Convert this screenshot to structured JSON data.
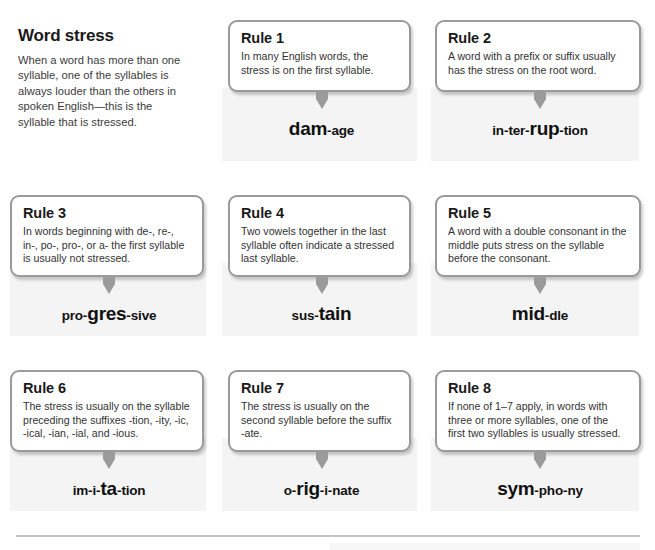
{
  "intro": {
    "title": "Word stress",
    "body": "When a word has more than one syllable, one of the syllables is always louder than the others in spoken English—this is the syllable that is stressed."
  },
  "rules": [
    {
      "title": "Rule 1",
      "body": "In many English words, the stress is on the first syllable.",
      "example_word": "dam-age",
      "syllables": [
        {
          "text": "dam",
          "stressed": true
        },
        {
          "text": "age",
          "stressed": false
        }
      ]
    },
    {
      "title": "Rule 2",
      "body": "A word with a prefix or suffix usually has the stress on the root word.",
      "example_word": "in-ter-rup-tion",
      "syllables": [
        {
          "text": "in",
          "stressed": false
        },
        {
          "text": "ter",
          "stressed": false
        },
        {
          "text": "rup",
          "stressed": true
        },
        {
          "text": "tion",
          "stressed": false
        }
      ]
    },
    {
      "title": "Rule 3",
      "body": "In words beginning with de-, re-, in-, po-, pro-, or a- the first syllable is usually not stressed.",
      "example_word": "pro-gres-sive",
      "syllables": [
        {
          "text": "pro",
          "stressed": false
        },
        {
          "text": "gres",
          "stressed": true
        },
        {
          "text": "sive",
          "stressed": false
        }
      ]
    },
    {
      "title": "Rule 4",
      "body": "Two vowels together in the last syllable often indicate a stressed last syllable.",
      "example_word": "sus-tain",
      "syllables": [
        {
          "text": "sus",
          "stressed": false
        },
        {
          "text": "tain",
          "stressed": true
        }
      ]
    },
    {
      "title": "Rule 5",
      "body": "A word with a double consonant in the middle puts stress on the syllable before the consonant.",
      "example_word": "mid-dle",
      "syllables": [
        {
          "text": "mid",
          "stressed": true
        },
        {
          "text": "dle",
          "stressed": false
        }
      ]
    },
    {
      "title": "Rule 6",
      "body": "The stress is usually on the syllable preceding the suffixes -tion, -ity, -ic, -ical, -ian, -ial, and -ious.",
      "example_word": "im-i-ta-tion",
      "syllables": [
        {
          "text": "im",
          "stressed": false
        },
        {
          "text": "i",
          "stressed": false
        },
        {
          "text": "ta",
          "stressed": true
        },
        {
          "text": "tion",
          "stressed": false
        }
      ]
    },
    {
      "title": "Rule 7",
      "body": "The stress is usually on the second syllable before the suffix -ate.",
      "example_word": "o-rig-i-nate",
      "syllables": [
        {
          "text": "o",
          "stressed": false
        },
        {
          "text": "rig",
          "stressed": true
        },
        {
          "text": "i",
          "stressed": false
        },
        {
          "text": "nate",
          "stressed": false
        }
      ]
    },
    {
      "title": "Rule 8",
      "body": "If none of 1–7 apply, in words with three or more syllables, one of the first two syllables is usually stressed.",
      "example_word": "sym-pho-ny",
      "syllables": [
        {
          "text": "sym",
          "stressed": true
        },
        {
          "text": "pho",
          "stressed": false
        },
        {
          "text": "ny",
          "stressed": false
        }
      ]
    }
  ],
  "icons": {
    "arrow": "down-arrow-icon"
  },
  "colors": {
    "card_border": "#9a9a9a",
    "panel_background": "#f4f4f4",
    "arrow": "#9b9b9b",
    "text": "#231f20",
    "divider": "#c4c4c4"
  }
}
